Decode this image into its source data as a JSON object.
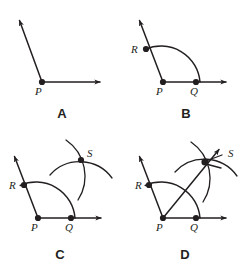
{
  "figure": {
    "background_color": "#ffffff",
    "ink_color": "#231f20",
    "width": 249,
    "height": 272
  },
  "panels": [
    {
      "id": "A",
      "label": "A",
      "label_pos": {
        "x": 62,
        "y": 118
      },
      "description": "Given angle with vertex P and two rays",
      "points": [
        {
          "name": "P",
          "label": "P",
          "x": 42,
          "y": 82,
          "label_x": 35,
          "label_y": 95
        }
      ],
      "rays": [
        {
          "name": "ray-PA-upper",
          "from": [
            42,
            82
          ],
          "to": [
            17,
            14
          ]
        },
        {
          "name": "ray-PA-right",
          "from": [
            42,
            82
          ],
          "to": [
            107,
            82
          ]
        }
      ],
      "arcs": []
    },
    {
      "id": "B",
      "label": "B",
      "label_pos": {
        "x": 186,
        "y": 118
      },
      "description": "Arc centered at P crossing both rays at R and Q",
      "points": [
        {
          "name": "P",
          "label": "P",
          "x": 163,
          "y": 82,
          "label_x": 156,
          "label_y": 95
        },
        {
          "name": "Q",
          "label": "Q",
          "x": 196,
          "y": 82,
          "label_x": 190,
          "label_y": 95
        },
        {
          "name": "R",
          "label": "R",
          "x": 145,
          "y": 48,
          "label_x": 131,
          "label_y": 52
        }
      ],
      "rays": [
        {
          "name": "ray-PB-upper",
          "from": [
            163,
            82
          ],
          "to": [
            137,
            14
          ]
        },
        {
          "name": "ray-PB-right",
          "from": [
            163,
            82
          ],
          "to": [
            233,
            82
          ]
        }
      ],
      "arcs": [
        {
          "name": "arc-RQ",
          "center": [
            163,
            82
          ],
          "radius": 37,
          "from": [
            145,
            48
          ],
          "to": [
            196,
            82
          ]
        }
      ]
    },
    {
      "id": "C",
      "label": "C",
      "label_pos": {
        "x": 60,
        "y": 259
      },
      "description": "Two arcs from R and Q intersecting at S",
      "points": [
        {
          "name": "P",
          "label": "P",
          "x": 38,
          "y": 218,
          "label_x": 31,
          "label_y": 231
        },
        {
          "name": "Q",
          "label": "Q",
          "x": 71,
          "y": 218,
          "label_x": 65,
          "label_y": 231
        },
        {
          "name": "R",
          "label": "R",
          "x": 24,
          "y": 184,
          "label_x": 10,
          "label_y": 188
        },
        {
          "name": "S",
          "label": "S",
          "x": 81,
          "y": 160,
          "label_x": 87,
          "label_y": 157
        }
      ],
      "rays": [
        {
          "name": "ray-PC-upper",
          "from": [
            38,
            218
          ],
          "to": [
            12,
            150
          ]
        },
        {
          "name": "ray-PC-right",
          "from": [
            38,
            218
          ],
          "to": [
            108,
            218
          ]
        }
      ],
      "arcs": [
        {
          "name": "arc-RQ",
          "center": [
            38,
            218
          ],
          "radius": 37,
          "from": [
            24,
            184
          ],
          "to": [
            71,
            218
          ]
        },
        {
          "name": "arc-from-R",
          "sweep": "intersecting arc drawn from R"
        },
        {
          "name": "arc-from-Q",
          "sweep": "intersecting arc drawn from Q"
        }
      ]
    },
    {
      "id": "D",
      "label": "D",
      "label_pos": {
        "x": 185,
        "y": 259
      },
      "description": "Bisector ray drawn from P through S",
      "points": [
        {
          "name": "P",
          "label": "P",
          "x": 163,
          "y": 218,
          "label_x": 156,
          "label_y": 231
        },
        {
          "name": "Q",
          "label": "Q",
          "x": 196,
          "y": 218,
          "label_x": 190,
          "label_y": 231
        },
        {
          "name": "R",
          "label": "R",
          "x": 149,
          "y": 184,
          "label_x": 135,
          "label_y": 188
        },
        {
          "name": "S",
          "label": "S",
          "x": 205,
          "y": 162,
          "label_x": 225,
          "label_y": 157
        }
      ],
      "rays": [
        {
          "name": "ray-PD-upper",
          "from": [
            163,
            218
          ],
          "to": [
            137,
            150
          ]
        },
        {
          "name": "ray-PD-right",
          "from": [
            163,
            218
          ],
          "to": [
            233,
            218
          ]
        },
        {
          "name": "ray-bisector-PS",
          "from": [
            163,
            218
          ],
          "to": [
            224,
            143
          ]
        }
      ],
      "arcs": [
        {
          "name": "arc-RQ",
          "center": [
            163,
            218
          ],
          "radius": 37,
          "from": [
            149,
            184
          ],
          "to": [
            196,
            218
          ]
        },
        {
          "name": "arc-from-R",
          "sweep": "intersecting arc drawn from R"
        },
        {
          "name": "arc-from-Q",
          "sweep": "intersecting arc drawn from Q"
        }
      ]
    }
  ]
}
